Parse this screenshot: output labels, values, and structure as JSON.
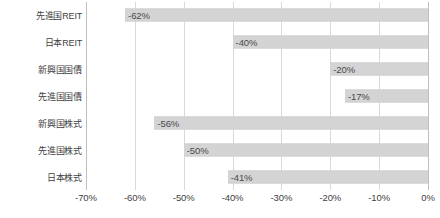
{
  "chart_data": {
    "type": "bar",
    "orientation": "horizontal",
    "title": "",
    "subtitle": "",
    "xlabel": "",
    "ylabel": "",
    "xlim": [
      -70,
      0
    ],
    "ylim": null,
    "grid": true,
    "legend": null,
    "legend_position": "none",
    "bar_color": "#d4d4d4",
    "gridline_color": "#d9d9d9",
    "axis_color": "#bfbfbf",
    "text_color": "#3f3f3f",
    "categories": [
      "先進国REIT",
      "日本REIT",
      "新興国国債",
      "先進国国債",
      "新興国株式",
      "先進国株式",
      "日本株式"
    ],
    "values": [
      -62,
      -40,
      -20,
      -17,
      -56,
      -50,
      -41
    ],
    "data_labels": [
      "-62%",
      "-40%",
      "-20%",
      "-17%",
      "-56%",
      "-50%",
      "-41%"
    ],
    "xticks": [
      -70,
      -60,
      -50,
      -40,
      -30,
      -20,
      -10,
      0
    ],
    "xticklabels": [
      "-70%",
      "-60%",
      "-50%",
      "-40%",
      "-30%",
      "-20%",
      "-10%",
      "0%"
    ]
  }
}
